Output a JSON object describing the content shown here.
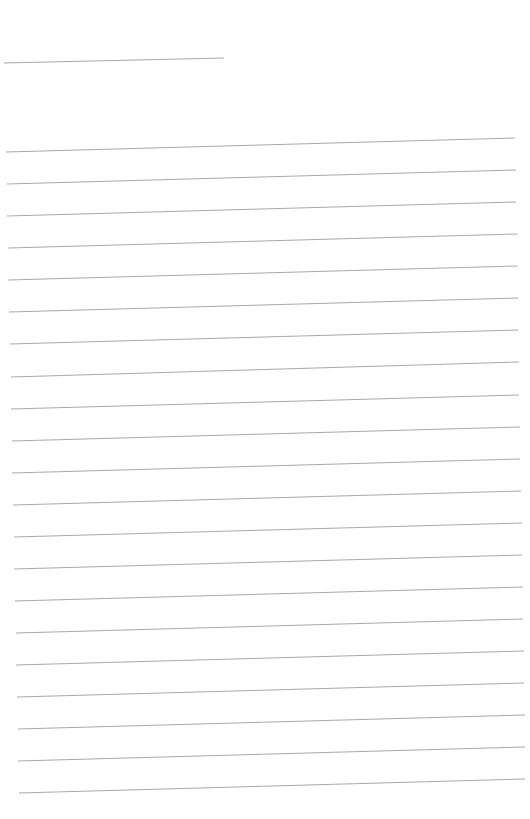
{
  "page": {
    "type": "blank-lined-sheet",
    "background": "#ffffff",
    "line_color": "#a8a8a8",
    "header_line": {
      "x1": 4,
      "y1": 63,
      "x2": 224,
      "y2": 58
    },
    "ruled_lines": [
      {
        "x1": 6,
        "y1": 152,
        "x2": 515,
        "y2": 138
      },
      {
        "x1": 7,
        "y1": 184,
        "x2": 516,
        "y2": 170
      },
      {
        "x1": 7,
        "y1": 216,
        "x2": 516,
        "y2": 202
      },
      {
        "x1": 8,
        "y1": 248,
        "x2": 517,
        "y2": 234
      },
      {
        "x1": 8,
        "y1": 280,
        "x2": 517,
        "y2": 266
      },
      {
        "x1": 9,
        "y1": 312,
        "x2": 518,
        "y2": 298
      },
      {
        "x1": 10,
        "y1": 344,
        "x2": 518,
        "y2": 330
      },
      {
        "x1": 11,
        "y1": 377,
        "x2": 519,
        "y2": 362
      },
      {
        "x1": 11,
        "y1": 409,
        "x2": 519,
        "y2": 395
      },
      {
        "x1": 12,
        "y1": 441,
        "x2": 520,
        "y2": 427
      },
      {
        "x1": 12,
        "y1": 473,
        "x2": 520,
        "y2": 459
      },
      {
        "x1": 13,
        "y1": 505,
        "x2": 521,
        "y2": 491
      },
      {
        "x1": 14,
        "y1": 537,
        "x2": 522,
        "y2": 523
      },
      {
        "x1": 14,
        "y1": 569,
        "x2": 522,
        "y2": 555
      },
      {
        "x1": 15,
        "y1": 601,
        "x2": 523,
        "y2": 587
      },
      {
        "x1": 16,
        "y1": 633,
        "x2": 523,
        "y2": 619
      },
      {
        "x1": 16,
        "y1": 665,
        "x2": 524,
        "y2": 651
      },
      {
        "x1": 17,
        "y1": 697,
        "x2": 524,
        "y2": 683
      },
      {
        "x1": 18,
        "y1": 729,
        "x2": 525,
        "y2": 715
      },
      {
        "x1": 18,
        "y1": 761,
        "x2": 525,
        "y2": 747
      },
      {
        "x1": 19,
        "y1": 793,
        "x2": 525,
        "y2": 779
      }
    ]
  }
}
